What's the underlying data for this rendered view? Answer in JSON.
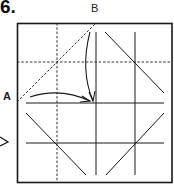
{
  "step": {
    "number": "6."
  },
  "labels": {
    "a": "A",
    "b": "B"
  },
  "colors": {
    "line": "#1a1a1a",
    "background": "#ffffff"
  },
  "diagram": {
    "frame": {
      "x": 17,
      "y": 23,
      "width": 155,
      "height": 160
    },
    "dashed_lines": [
      {
        "name": "vertical-valley-fold",
        "x1": 57,
        "y1": 23,
        "x2": 57,
        "y2": 183
      },
      {
        "name": "horizontal-valley-fold",
        "x1": 17,
        "y1": 62,
        "x2": 172,
        "y2": 62
      },
      {
        "name": "diagonal-valley-fold",
        "x1": 17,
        "y1": 102,
        "x2": 96,
        "y2": 23
      }
    ],
    "solid_lines": [
      {
        "x1": 96,
        "y1": 32,
        "x2": 96,
        "y2": 175
      },
      {
        "x1": 135,
        "y1": 32,
        "x2": 135,
        "y2": 175
      },
      {
        "x1": 26,
        "y1": 103,
        "x2": 164,
        "y2": 103
      },
      {
        "x1": 26,
        "y1": 143,
        "x2": 164,
        "y2": 143
      },
      {
        "x1": 105,
        "y1": 32,
        "x2": 164,
        "y2": 93
      },
      {
        "x1": 26,
        "y1": 113,
        "x2": 86,
        "y2": 175
      },
      {
        "x1": 164,
        "y1": 113,
        "x2": 106,
        "y2": 175
      }
    ],
    "arrows": [
      {
        "name": "arrow-a-to-center",
        "from": "A",
        "path": "M30,97 Q60,87 92,101"
      },
      {
        "name": "arrow-b-to-center",
        "from": "B",
        "path": "M90,32 Q80,70 93,101"
      }
    ]
  }
}
